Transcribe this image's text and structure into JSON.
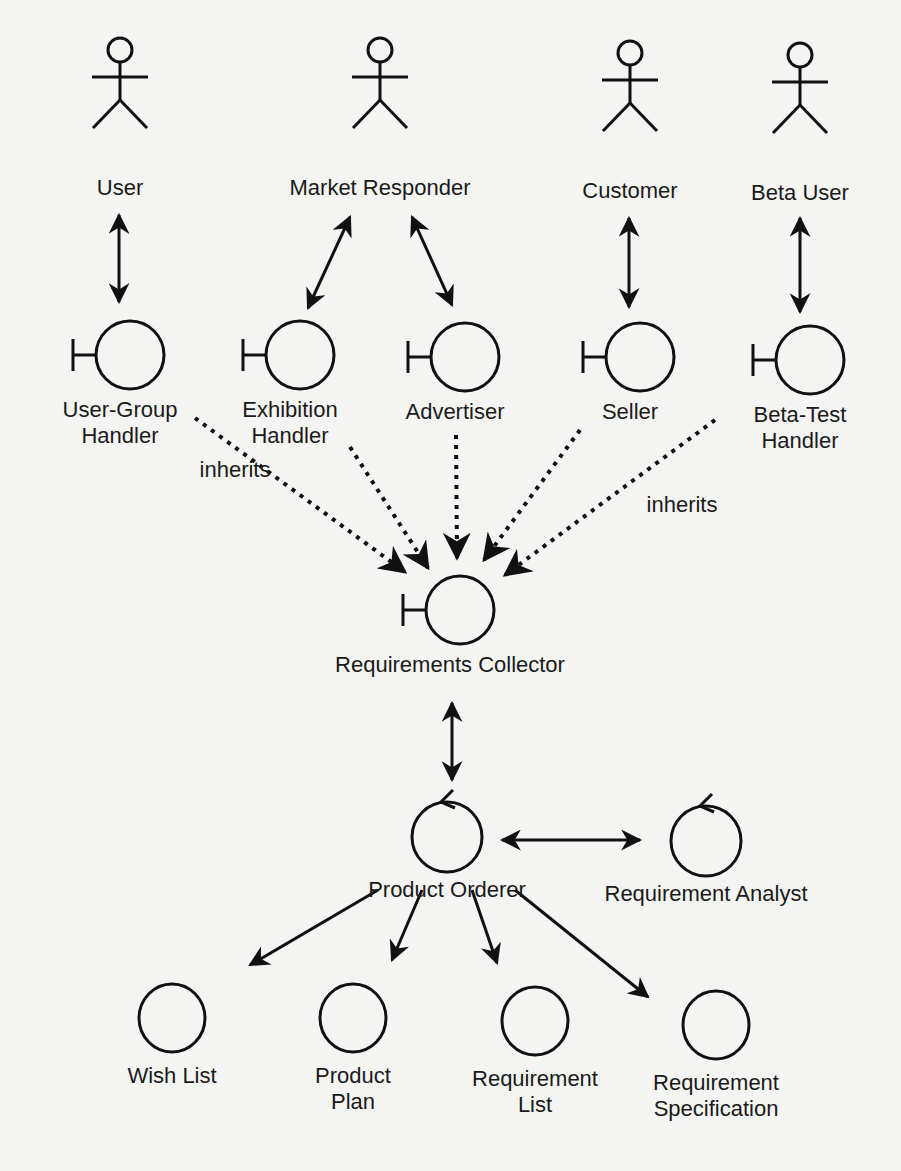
{
  "actors": [
    {
      "id": "user",
      "label": "User",
      "x": 120,
      "y": 75
    },
    {
      "id": "market",
      "label": "Market Responder",
      "x": 380,
      "y": 75
    },
    {
      "id": "customer",
      "label": "Customer",
      "x": 630,
      "y": 78
    },
    {
      "id": "beta",
      "label": "Beta User",
      "x": 800,
      "y": 80
    }
  ],
  "boundaries": [
    {
      "id": "ugh",
      "lines": [
        "User-Group",
        "Handler"
      ],
      "x": 130,
      "y": 355
    },
    {
      "id": "exh",
      "lines": [
        "Exhibition",
        "Handler"
      ],
      "x": 300,
      "y": 355
    },
    {
      "id": "adv",
      "lines": [
        "Advertiser"
      ],
      "x": 465,
      "y": 357
    },
    {
      "id": "sel",
      "lines": [
        "Seller"
      ],
      "x": 640,
      "y": 357
    },
    {
      "id": "bth",
      "lines": [
        "Beta-Test",
        "Handler"
      ],
      "x": 810,
      "y": 360
    },
    {
      "id": "rc",
      "lines": [
        "Requirements Collector"
      ],
      "x": 460,
      "y": 610
    }
  ],
  "controls": [
    {
      "id": "po",
      "label": "Product Orderer",
      "x": 447,
      "y": 842
    },
    {
      "id": "ra",
      "label": "Requirement Analyst",
      "x": 706,
      "y": 846
    }
  ],
  "entities": [
    {
      "id": "wl",
      "lines": [
        "Wish List"
      ],
      "x": 172,
      "y": 1018
    },
    {
      "id": "pp",
      "lines": [
        "Product",
        "Plan"
      ],
      "x": 353,
      "y": 1018
    },
    {
      "id": "rl",
      "lines": [
        "Requirement",
        "List"
      ],
      "x": 535,
      "y": 1021
    },
    {
      "id": "rs",
      "lines": [
        "Requirement",
        "Specification"
      ],
      "x": 716,
      "y": 1025
    }
  ],
  "annotations": [
    {
      "text": "inherits",
      "x": 235,
      "y": 477
    },
    {
      "text": "inherits",
      "x": 682,
      "y": 512
    }
  ],
  "connections": {
    "bidirectional": [
      [
        119,
        215,
        119,
        302
      ],
      [
        350,
        217,
        308,
        308
      ],
      [
        412,
        217,
        452,
        305
      ],
      [
        629,
        218,
        629,
        307
      ],
      [
        800,
        218,
        800,
        312
      ],
      [
        452,
        703,
        452,
        780
      ],
      [
        502,
        840,
        640,
        840
      ]
    ],
    "dotted": [
      [
        195,
        418,
        405,
        572
      ],
      [
        350,
        447,
        428,
        568
      ],
      [
        456,
        435,
        457,
        558
      ],
      [
        580,
        430,
        484,
        560
      ],
      [
        715,
        420,
        505,
        575
      ]
    ],
    "directed": [
      [
        378,
        890,
        250,
        965
      ],
      [
        422,
        890,
        392,
        960
      ],
      [
        472,
        890,
        497,
        963
      ],
      [
        515,
        890,
        648,
        997
      ]
    ]
  }
}
